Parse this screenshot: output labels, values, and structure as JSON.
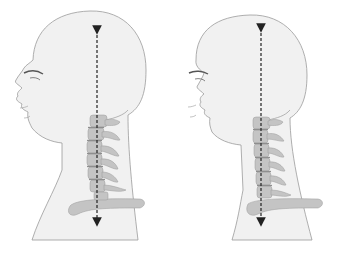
{
  "figure": {
    "panels": [
      {
        "id": "left",
        "posture": "forward-head",
        "spine_curve": "curved"
      },
      {
        "id": "right",
        "posture": "aligned",
        "spine_curve": "straight"
      }
    ],
    "colors": {
      "skin": "#f1f1f1",
      "outline": "#9a9a9a",
      "bone": "#c4c4c4",
      "bone_dark": "#8e8e8e",
      "arrow": "#222222"
    }
  }
}
